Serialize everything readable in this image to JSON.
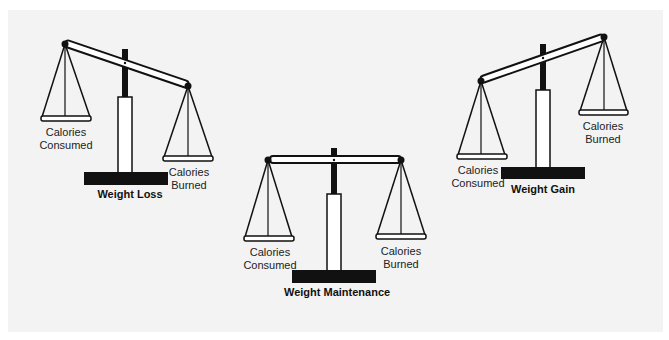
{
  "figure": {
    "scales": [
      {
        "id": "weight-loss",
        "title": "Weight Loss",
        "left_pan_label": [
          "Calories",
          "Consumed"
        ],
        "right_pan_label": [
          "Calories",
          "Burned"
        ],
        "tilt": "right side down"
      },
      {
        "id": "weight-maintenance",
        "title": "Weight Maintenance",
        "left_pan_label": [
          "Calories",
          "Consumed"
        ],
        "right_pan_label": [
          "Calories",
          "Burned"
        ],
        "tilt": "balanced"
      },
      {
        "id": "weight-gain",
        "title": "Weight Gain",
        "left_pan_label": [
          "Calories",
          "Consumed"
        ],
        "right_pan_label": [
          "Calories",
          "Burned"
        ],
        "tilt": "left side down"
      }
    ]
  },
  "colors": {
    "background": "#f3f3f3",
    "ink": "#111111",
    "fill": "#ffffff"
  }
}
